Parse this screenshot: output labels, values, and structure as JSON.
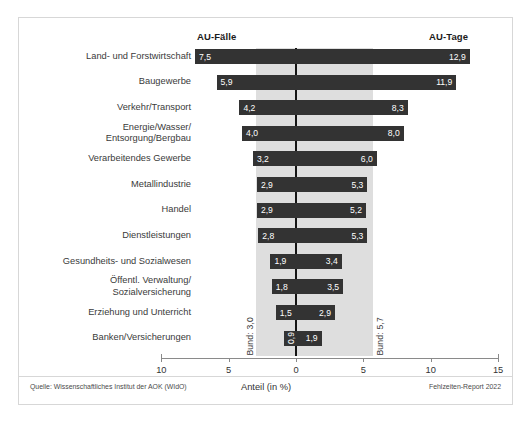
{
  "header": {
    "left_label": "AU-Fälle",
    "right_label": "AU-Tage"
  },
  "footer": {
    "source": "Quelle: Wissenschaftliches Institut der AOK (WIdO)",
    "report": "Fehlzeiten-Report 2022"
  },
  "annotations": {
    "bund_left": "Bund: 3,0",
    "bund_right": "Bund: 5,7"
  },
  "colors": {
    "bar": "#333333",
    "band": "#dedede",
    "zero_line": "#141414",
    "axis": "#8a8a8a",
    "frame": "#d7d7d7",
    "value_text": "#ffffff",
    "label_text": "#3a3a3a"
  },
  "chart_data": {
    "type": "bar",
    "title": "",
    "subtitle": "",
    "xlabel": "Anteil (in %)",
    "ylabel": "",
    "xlim": [
      -10,
      15
    ],
    "grid": false,
    "legend_position": "top",
    "orientation": "horizontal-diverging",
    "axis_ticks": [
      {
        "value": -10,
        "label": "10"
      },
      {
        "value": -5,
        "label": "5"
      },
      {
        "value": 0,
        "label": "0"
      },
      {
        "value": 5,
        "label": "5"
      },
      {
        "value": 10,
        "label": "10"
      },
      {
        "value": 15,
        "label": "15"
      }
    ],
    "reference_band": {
      "label_left": "Bund: 3,0",
      "label_right": "Bund: 5,7",
      "left_value": 3.0,
      "right_value": 5.7
    },
    "categories": [
      "Land- und Forstwirtschaft",
      "Baugewerbe",
      "Verkehr/Transport",
      "Energie/Wasser/\nEntsorgung/Bergbau",
      "Verarbeitendes Gewerbe",
      "Metallindustrie",
      "Handel",
      "Dienstleistungen",
      "Gesundheits- und Sozialwesen",
      "Öffentl. Verwaltung/\nSozialversicherung",
      "Erziehung und Unterricht",
      "Banken/Versicherungen"
    ],
    "series": [
      {
        "name": "AU-Fälle",
        "direction": "left",
        "values": [
          7.5,
          5.9,
          4.2,
          4.0,
          3.2,
          2.9,
          2.9,
          2.8,
          1.9,
          1.8,
          1.5,
          0.9
        ],
        "labels": [
          "7,5",
          "5,9",
          "4,2",
          "4,0",
          "3,2",
          "2,9",
          "2,9",
          "2,8",
          "1,9",
          "1,8",
          "1,5",
          "0,9"
        ]
      },
      {
        "name": "AU-Tage",
        "direction": "right",
        "values": [
          12.9,
          11.9,
          8.3,
          8.0,
          6.0,
          5.3,
          5.2,
          5.3,
          3.4,
          3.5,
          2.9,
          1.9
        ],
        "labels": [
          "12,9",
          "11,9",
          "8,3",
          "8,0",
          "6,0",
          "5,3",
          "5,2",
          "5,3",
          "3,4",
          "3,5",
          "2,9",
          "1,9"
        ]
      }
    ]
  }
}
